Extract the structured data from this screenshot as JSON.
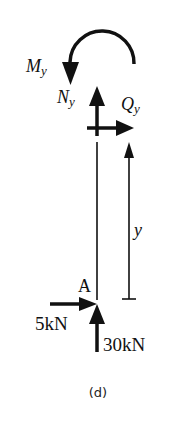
{
  "figure": {
    "caption": "(d)",
    "colors": {
      "ink": "#111111",
      "background": "#ffffff"
    }
  },
  "labels": {
    "moment": {
      "main": "M",
      "sub": "y"
    },
    "normal_force": {
      "main": "N",
      "sub": "y"
    },
    "shear_force": {
      "main": "Q",
      "sub": "y"
    },
    "coordinate": "y",
    "point": "A",
    "horizontal_load": "5kN",
    "vertical_load": "30kN"
  },
  "forces": [
    {
      "name": "M_y",
      "type": "moment",
      "direction": "counterclockwise"
    },
    {
      "name": "N_y",
      "type": "axial",
      "direction": "up"
    },
    {
      "name": "Q_y",
      "type": "shear",
      "direction": "right"
    },
    {
      "name": "5kN",
      "type": "point-load",
      "direction": "right",
      "at": "A"
    },
    {
      "name": "30kN",
      "type": "point-load",
      "direction": "up",
      "at": "A"
    }
  ]
}
